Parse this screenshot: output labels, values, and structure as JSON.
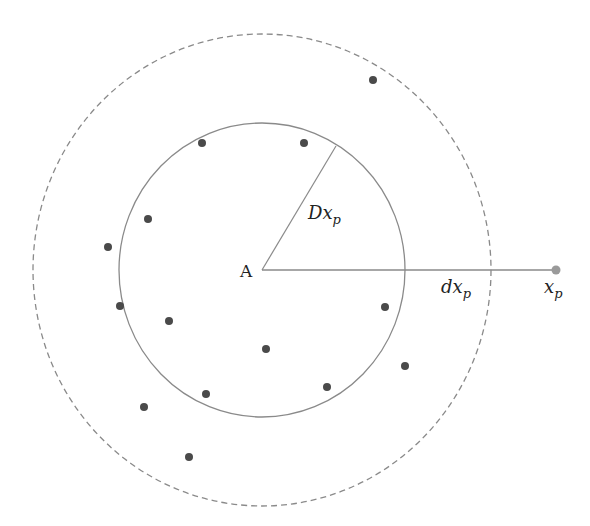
{
  "diagram": {
    "center": {
      "x": 262,
      "y": 270,
      "label": "A"
    },
    "inner_circle": {
      "rx": 143,
      "ry": 147,
      "style": "solid",
      "color": "#8a8a8a"
    },
    "outer_circle": {
      "rx": 229,
      "ry": 236,
      "style": "dashed",
      "color": "#8a8a8a"
    },
    "radius_line": {
      "x2": 336,
      "y2": 146,
      "label_main": "Dx",
      "label_sub": "p"
    },
    "distance_line": {
      "x2": 556,
      "y2": 270,
      "label_main": "dx",
      "label_sub": "p"
    },
    "point": {
      "x": 556,
      "y": 270,
      "label_main": "x",
      "label_sub": "p",
      "color": "#9a9a9a"
    },
    "dot_color": "#4a4a4a",
    "dots": [
      {
        "x": 373,
        "y": 80
      },
      {
        "x": 202,
        "y": 143
      },
      {
        "x": 304,
        "y": 143
      },
      {
        "x": 148,
        "y": 219
      },
      {
        "x": 108,
        "y": 247
      },
      {
        "x": 120,
        "y": 306
      },
      {
        "x": 169,
        "y": 321
      },
      {
        "x": 385,
        "y": 307
      },
      {
        "x": 266,
        "y": 349
      },
      {
        "x": 405,
        "y": 366
      },
      {
        "x": 327,
        "y": 387
      },
      {
        "x": 206,
        "y": 394
      },
      {
        "x": 144,
        "y": 407
      },
      {
        "x": 189,
        "y": 457
      }
    ]
  }
}
